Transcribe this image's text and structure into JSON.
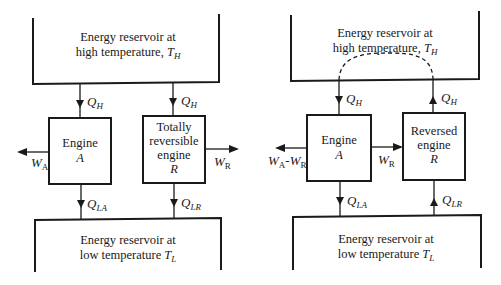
{
  "left_diagram": {
    "high_reservoir": {
      "line1": "Energy reservoir at",
      "line2": "high temperature, ",
      "T": "T",
      "T_sub": "H"
    },
    "low_reservoir": {
      "line1": "Energy reservoir at",
      "line2": "low temperature ",
      "T": "T",
      "T_sub": "L"
    },
    "engine_a": {
      "line1": "Engine",
      "line2": "A"
    },
    "engine_r": {
      "line1": "Totally",
      "line2": "reversible",
      "line3": "engine",
      "line4": "R"
    },
    "q_h_a": {
      "main": "Q",
      "sub": "H"
    },
    "q_h_r": {
      "main": "Q",
      "sub": "H"
    },
    "q_la": {
      "main": "Q",
      "sub": "LA"
    },
    "q_lr": {
      "main": "Q",
      "sub": "LR"
    },
    "w_a": {
      "main": "W",
      "sub": "A"
    },
    "w_r": {
      "main": "W",
      "sub": "R"
    }
  },
  "right_diagram": {
    "high_reservoir": {
      "line1": "Energy reservoir at",
      "line2": "high temperature, ",
      "T": "T",
      "T_sub": "H"
    },
    "low_reservoir": {
      "line1": "Energy reservoir at",
      "line2": "low temperature ",
      "T": "T",
      "T_sub": "L"
    },
    "engine_a": {
      "line1": "Engine",
      "line2": "A"
    },
    "engine_r": {
      "line1": "Reversed",
      "line2": "engine",
      "line3": "R"
    },
    "q_h_a": {
      "main": "Q",
      "sub": "H"
    },
    "q_h_r": {
      "main": "Q",
      "sub": "H"
    },
    "q_la": {
      "main": "Q",
      "sub": "LA"
    },
    "q_lr": {
      "main": "Q",
      "sub": "LR"
    },
    "w_net": {
      "main1": "W",
      "sub1": "A",
      "dash": "-",
      "main2": "W",
      "sub2": "R"
    },
    "w_r": {
      "main": "W",
      "sub": "R"
    }
  }
}
